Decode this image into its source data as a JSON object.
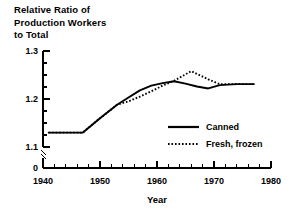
{
  "chart_data": {
    "type": "line",
    "title": "Relative Ratio of\nProduction Workers\nto Total",
    "title_lines": [
      "Relative Ratio of",
      "Production Workers",
      "to Total"
    ],
    "xlabel": "Year",
    "ylabel": "",
    "xlim": [
      1940,
      1980
    ],
    "ylim": [
      1.1,
      1.3
    ],
    "y_axis_break": true,
    "y_break_label": "0",
    "grid": false,
    "legend_position": "center-right-inside",
    "xticks": [
      1940,
      1950,
      1960,
      1970,
      1980
    ],
    "xtick_labels": [
      "1940",
      "1950",
      "1960",
      "1970",
      "1980"
    ],
    "x_minor_tick_interval": 2,
    "yticks": [
      1.1,
      1.2,
      1.3
    ],
    "ytick_labels": [
      "1.1",
      "1.2",
      "1.3"
    ],
    "y_minor_ticks": [
      1.125,
      1.15,
      1.175,
      1.225,
      1.25,
      1.275
    ],
    "series": [
      {
        "name": "Canned",
        "style": "solid",
        "color": "#000000",
        "x": [
          1941,
          1944,
          1947,
          1950,
          1953,
          1955,
          1957,
          1959,
          1961,
          1963,
          1965,
          1967,
          1969,
          1971,
          1974,
          1977
        ],
        "values": [
          1.13,
          1.13,
          1.13,
          1.16,
          1.188,
          1.203,
          1.218,
          1.228,
          1.233,
          1.237,
          1.232,
          1.226,
          1.222,
          1.229,
          1.231,
          1.231
        ]
      },
      {
        "name": "Fresh, frozen",
        "style": "dotted",
        "color": "#000000",
        "x": [
          1941,
          1944,
          1947,
          1950,
          1953,
          1955,
          1957,
          1959,
          1961,
          1963,
          1966,
          1969,
          1971,
          1974,
          1977
        ],
        "values": [
          1.13,
          1.13,
          1.13,
          1.16,
          1.188,
          1.195,
          1.205,
          1.216,
          1.228,
          1.238,
          1.258,
          1.241,
          1.231,
          1.231,
          1.231
        ]
      }
    ],
    "legend_entries": [
      {
        "label": "Canned",
        "style": "solid"
      },
      {
        "label": "Fresh, frozen",
        "style": "dotted"
      }
    ]
  }
}
